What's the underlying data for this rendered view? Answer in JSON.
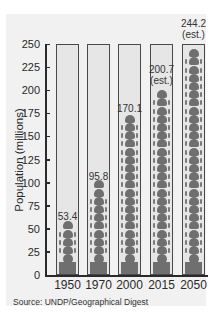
{
  "chart_data": {
    "type": "bar",
    "title": "",
    "xlabel": "",
    "ylabel": "Population (millions)",
    "ylim": [
      0,
      250
    ],
    "yticks": [
      0,
      25,
      50,
      75,
      100,
      125,
      150,
      175,
      200,
      225,
      250
    ],
    "categories": [
      "1950",
      "1970",
      "2000",
      "2015",
      "2050"
    ],
    "values": [
      53.4,
      95.8,
      170.1,
      200.7,
      244.2
    ],
    "value_labels": [
      "53.4",
      "95.8",
      "170.1",
      "200.7\n(est.)",
      "244.2\n(est.)"
    ],
    "estimated": [
      false,
      false,
      false,
      true,
      true
    ],
    "style": "pictograph of stacked human figures inside framed columns",
    "grid": false,
    "legend": null,
    "source": "Source: UNDP/Geographical Digest"
  },
  "axis": {
    "ylabel": "Population (millions)",
    "ticks": [
      "0",
      "25",
      "50",
      "75",
      "100",
      "125",
      "150",
      "175",
      "200",
      "225",
      "250"
    ]
  },
  "columns": [
    {
      "year": "1950",
      "label": "53.4",
      "est": ""
    },
    {
      "year": "1970",
      "label": "95.8",
      "est": ""
    },
    {
      "year": "2000",
      "label": "170.1",
      "est": ""
    },
    {
      "year": "2015",
      "label": "200.7",
      "est": "(est.)"
    },
    {
      "year": "2050",
      "label": "244.2",
      "est": "(est.)"
    }
  ],
  "source": "Source: UNDP/Geographical Digest",
  "colors": {
    "figure": "#6f6f6f",
    "column_bg": "#e6e6e6",
    "panel_bg": "#f1f1f1",
    "axis": "#2a2a2a"
  }
}
